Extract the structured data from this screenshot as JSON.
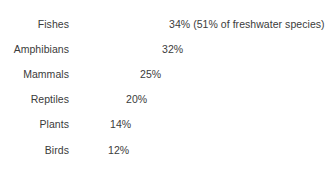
{
  "chart_data": {
    "type": "bar",
    "orientation": "horizontal",
    "title": "",
    "subtitle": "",
    "xlabel": "",
    "ylabel": "",
    "grid": false,
    "legend": null,
    "axis_visible": false,
    "xlim": [
      0,
      40
    ],
    "categories": [
      "Fishes",
      "Amphibians",
      "Mammals",
      "Reptiles",
      "Plants",
      "Birds"
    ],
    "values": [
      34,
      32,
      25,
      20,
      14,
      12
    ],
    "value_labels": [
      "34%",
      "32%",
      "25%",
      "20%",
      "14%",
      "12%"
    ],
    "annotations": [
      {
        "category": "Fishes",
        "text": "(51% of freshwater species)"
      }
    ],
    "bar_color": "#585858",
    "text_color": "#3b3b3b",
    "background_color": "#ffffff"
  },
  "rows": [
    {
      "label": "Fishes",
      "value": 34,
      "value_text": "34% (51% of freshwater species)",
      "bar_px": 91,
      "top": 16
    },
    {
      "label": "Amphibians",
      "value": 32,
      "value_text": "32%",
      "bar_px": 84,
      "top": 41
    },
    {
      "label": "Mammals",
      "value": 25,
      "value_text": "25%",
      "bar_px": 62,
      "top": 66
    },
    {
      "label": "Reptiles",
      "value": 20,
      "value_text": "20%",
      "bar_px": 48,
      "top": 91
    },
    {
      "label": "Plants",
      "value": 14,
      "value_text": "14%",
      "bar_px": 32,
      "top": 116
    },
    {
      "label": "Birds",
      "value": 12,
      "value_text": "12%",
      "bar_px": 30,
      "top": 142
    }
  ]
}
